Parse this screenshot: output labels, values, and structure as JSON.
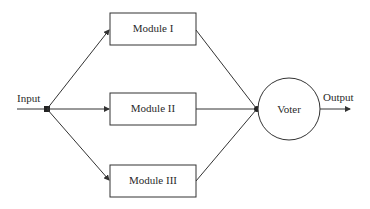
{
  "diagram": {
    "type": "triple-modular-redundancy",
    "input_label": "Input",
    "output_label": "Output",
    "modules": [
      {
        "label": "Module I"
      },
      {
        "label": "Module II"
      },
      {
        "label": "Module III"
      }
    ],
    "voter_label": "Voter",
    "colors": {
      "stroke": "#333333",
      "text": "#2a2a2a",
      "background": "#ffffff"
    }
  }
}
